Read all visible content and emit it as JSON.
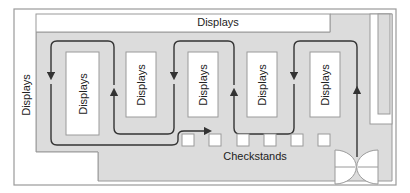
{
  "diagram": {
    "labels": {
      "top_displays": "Displays",
      "left_displays": "Displays",
      "checkstands": "Checkstands"
    },
    "display_blocks": [
      {
        "label": "Displays"
      },
      {
        "label": "Displays"
      },
      {
        "label": "Displays"
      },
      {
        "label": "Displays"
      },
      {
        "label": "Displays"
      }
    ],
    "checkstand_count": 6,
    "colors": {
      "floor": "#dcdcdc",
      "wall": "#9a9a9a",
      "display": "#ffffff",
      "path": "#333333"
    }
  }
}
